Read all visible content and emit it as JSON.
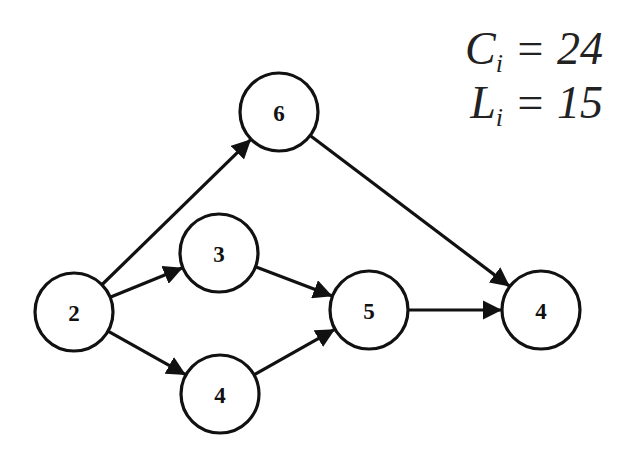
{
  "annotations": {
    "C": {
      "symbol": "C",
      "subscript": "i",
      "eq": " = ",
      "value": "24"
    },
    "L": {
      "symbol": "L",
      "subscript": "i",
      "eq": " = ",
      "value": "15"
    }
  },
  "nodes": [
    {
      "id": "n2",
      "label": "2",
      "x": 74,
      "y": 312
    },
    {
      "id": "n3",
      "label": "3",
      "x": 219,
      "y": 253
    },
    {
      "id": "n4a",
      "label": "4",
      "x": 220,
      "y": 394
    },
    {
      "id": "n6",
      "label": "6",
      "x": 279,
      "y": 112
    },
    {
      "id": "n5",
      "label": "5",
      "x": 369,
      "y": 310
    },
    {
      "id": "n4b",
      "label": "4",
      "x": 541,
      "y": 310
    }
  ],
  "edges": [
    {
      "from": "n2",
      "to": "n6"
    },
    {
      "from": "n2",
      "to": "n3"
    },
    {
      "from": "n2",
      "to": "n4a"
    },
    {
      "from": "n3",
      "to": "n5"
    },
    {
      "from": "n4a",
      "to": "n5"
    },
    {
      "from": "n5",
      "to": "n4b"
    },
    {
      "from": "n6",
      "to": "n4b"
    }
  ],
  "style": {
    "stroke_color": "#111111",
    "background": "#ffffff"
  }
}
